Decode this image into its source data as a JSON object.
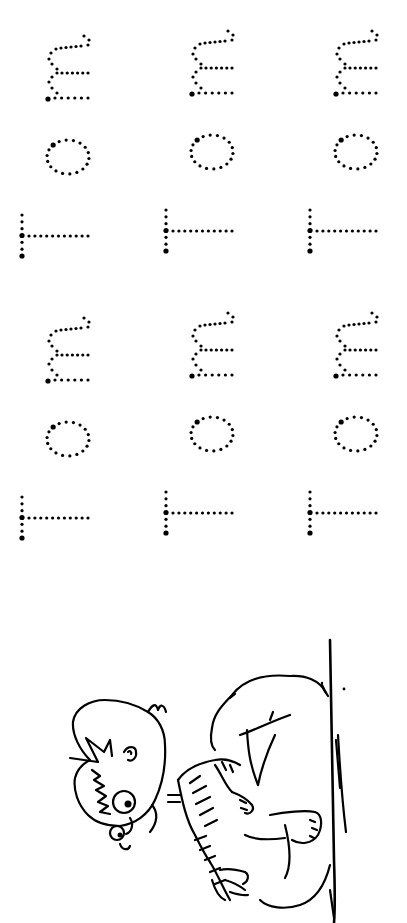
{
  "worksheet": {
    "type": "name tracing worksheet",
    "name_to_trace": "Tom",
    "letters": [
      "T",
      "o",
      "m"
    ],
    "orientation": "rotated 90° counter-clockwise (reads bottom to top)",
    "ink_color": "#000000",
    "background_color": "#ffffff",
    "blocks": [
      {
        "label": "upper block",
        "words": [
          {
            "text": "Tom",
            "x": 0,
            "y": 0
          },
          {
            "text": "Tom",
            "x": 144,
            "y": -5
          },
          {
            "text": "Tom",
            "x": 288,
            "y": -5
          }
        ]
      },
      {
        "label": "lower block",
        "words": [
          {
            "text": "Tom",
            "x": 0,
            "y": 282
          },
          {
            "text": "Tom",
            "x": 144,
            "y": 277
          },
          {
            "text": "Tom",
            "x": 288,
            "y": 277
          }
        ]
      }
    ]
  },
  "illustration": {
    "subject": "cartoon boy sitting on the ground hugging his knees",
    "style": "black line art coloring page",
    "orientation": "rotated 90° counter-clockwise"
  }
}
